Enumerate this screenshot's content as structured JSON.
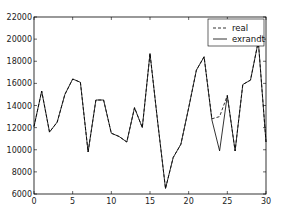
{
  "chart_data": {
    "type": "line",
    "title": "",
    "xlabel": "",
    "ylabel": "",
    "xlim": [
      0,
      30
    ],
    "ylim": [
      6000,
      22000
    ],
    "grid": false,
    "legend_position": "upper right",
    "x_ticks": [
      0,
      5,
      10,
      15,
      20,
      25,
      30
    ],
    "x_tick_labels": [
      "0",
      "5",
      "10",
      "15",
      "20",
      "25",
      "30"
    ],
    "y_ticks": [
      6000,
      8000,
      10000,
      12000,
      14000,
      16000,
      18000,
      20000,
      22000
    ],
    "y_tick_labels": [
      "6000",
      "8000",
      "10000",
      "12000",
      "14000",
      "16000",
      "18000",
      "20000",
      "22000"
    ],
    "x": [
      0,
      1,
      2,
      3,
      4,
      5,
      6,
      7,
      8,
      9,
      10,
      11,
      12,
      13,
      14,
      15,
      16,
      17,
      18,
      19,
      20,
      21,
      22,
      23,
      24,
      25,
      26,
      27,
      28,
      29,
      30
    ],
    "series": [
      {
        "name": "real",
        "style": "dashed",
        "color": "#000000",
        "values": [
          12100,
          15300,
          11600,
          12500,
          15000,
          16400,
          16100,
          9800,
          14500,
          14500,
          11500,
          11200,
          10700,
          13800,
          12000,
          18700,
          12500,
          6500,
          9300,
          10500,
          13800,
          17200,
          18400,
          12800,
          13000,
          14900,
          9900,
          15900,
          16300,
          19800,
          10700
        ]
      },
      {
        "name": "exrandt",
        "style": "solid",
        "color": "#000000",
        "values": [
          12100,
          15300,
          11600,
          12500,
          15000,
          16400,
          16100,
          9800,
          14500,
          14500,
          11500,
          11200,
          10700,
          13800,
          12000,
          18700,
          12500,
          6500,
          9300,
          10500,
          13800,
          17200,
          18400,
          12700,
          9900,
          14900,
          9900,
          15900,
          16300,
          19800,
          10700
        ]
      }
    ]
  },
  "legend": {
    "items": [
      {
        "label": "real",
        "style": "dashed"
      },
      {
        "label": "exrandt",
        "style": "solid"
      }
    ]
  }
}
